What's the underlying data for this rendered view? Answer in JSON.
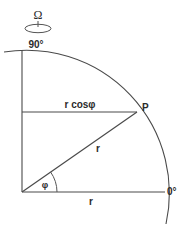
{
  "figure": {
    "background_color": "#ffffff",
    "line_color": "#4a4a4a",
    "text_color": "#2b2b2b"
  },
  "labels": {
    "omega": "Ω",
    "pole_90": "90°",
    "equator_0": "0°",
    "point_p": "P",
    "r_cos_phi": "r cosφ",
    "r_radius": "r",
    "r_baseline": "r",
    "phi_angle": "φ"
  },
  "geometry": {
    "origin_x": 22,
    "origin_y": 192,
    "radius": 143,
    "phi_degrees": 34,
    "point_p_x": 137,
    "point_p_y": 112,
    "axis_top_y": 50,
    "axis_right_x": 165
  },
  "icons": {
    "rotation_ellipse": "rotation-ellipse-icon",
    "spin_axis": "spin-axis-icon"
  }
}
